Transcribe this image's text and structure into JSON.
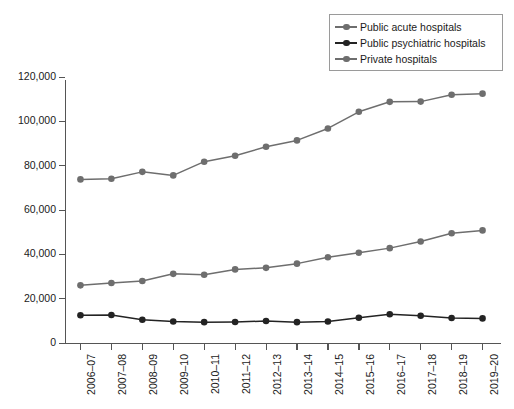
{
  "chart_data": {
    "type": "line",
    "title": "",
    "subtitle": "",
    "xlabel": "",
    "ylabel": "",
    "grid": false,
    "legend_position": "top-right",
    "ylim": [
      0,
      120000
    ],
    "yticks": [
      0,
      20000,
      40000,
      60000,
      80000,
      100000,
      120000
    ],
    "ytick_labels": [
      "0",
      "20,000",
      "40,000",
      "60,000",
      "80,000",
      "100,000",
      "120,000"
    ],
    "categories": [
      "2006–07",
      "2007–08",
      "2008–09",
      "2009–10",
      "2010–11",
      "2011–12",
      "2012–13",
      "2013–14",
      "2014–15",
      "2015–16",
      "2016–17",
      "2017–18",
      "2018–19",
      "2019–20"
    ],
    "series": [
      {
        "name": "Public acute hospitals",
        "color": "#6e6e6e",
        "values": [
          73800,
          74100,
          77200,
          75600,
          81800,
          84500,
          88500,
          91400,
          96800,
          104300,
          108800,
          108900,
          112000,
          112500
        ]
      },
      {
        "name": "Public psychiatric hospitals",
        "color": "#232323",
        "values": [
          12500,
          12600,
          10500,
          9700,
          9400,
          9500,
          9900,
          9400,
          9700,
          11400,
          13000,
          12300,
          11300,
          11100
        ]
      },
      {
        "name": "Private hospitals",
        "color": "#6e6e6e",
        "values": [
          26000,
          27100,
          28000,
          31200,
          30800,
          33200,
          33900,
          35800,
          38700,
          40700,
          42800,
          45800,
          49500,
          50800
        ]
      }
    ]
  },
  "legend": {
    "entries": [
      {
        "label": "Public acute hospitals",
        "color": "#6e6e6e"
      },
      {
        "label": "Public psychiatric hospitals",
        "color": "#232323"
      },
      {
        "label": "Private hospitals",
        "color": "#6e6e6e"
      }
    ]
  }
}
